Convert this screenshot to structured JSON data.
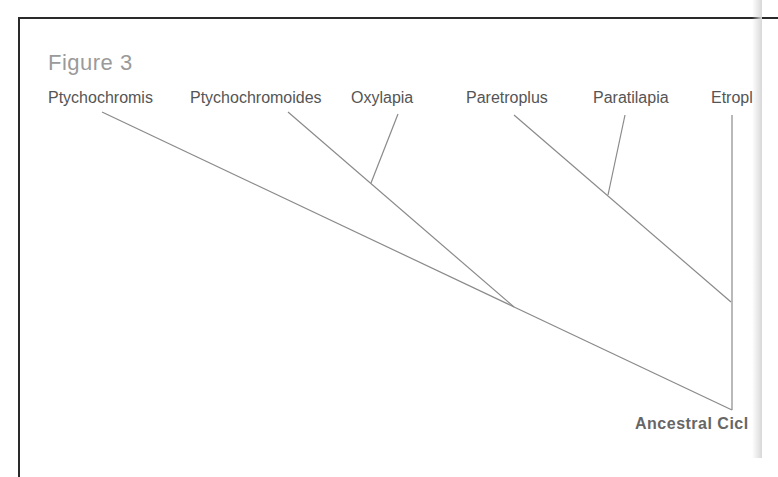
{
  "figure": {
    "title": "Figure 3",
    "taxa": [
      {
        "label": "Ptychochromis",
        "x": 48
      },
      {
        "label": "Ptychochromoides",
        "x": 190
      },
      {
        "label": "Oxylapia",
        "x": 351
      },
      {
        "label": "Paretroplus",
        "x": 466
      },
      {
        "label": "Paratilapia",
        "x": 593
      },
      {
        "label": "Etropl",
        "x": 711
      }
    ],
    "root_label": "Ancestral Cicl",
    "edges": [
      {
        "from": "Ptychochromis",
        "x1": 102,
        "y1": 112,
        "x2": 732,
        "y2": 410
      },
      {
        "from": "Ptychochromoides",
        "x1": 288,
        "y1": 112,
        "x2": 514,
        "y2": 307
      },
      {
        "from": "Oxylapia",
        "x1": 398,
        "y1": 114,
        "x2": 371,
        "y2": 183
      },
      {
        "from": "Paretroplus",
        "x1": 514,
        "y1": 115,
        "x2": 731,
        "y2": 302
      },
      {
        "from": "Paratilapia",
        "x1": 625,
        "y1": 115,
        "x2": 608,
        "y2": 195
      },
      {
        "from": "Etropl",
        "x1": 732,
        "y1": 115,
        "x2": 732,
        "y2": 410
      }
    ]
  }
}
